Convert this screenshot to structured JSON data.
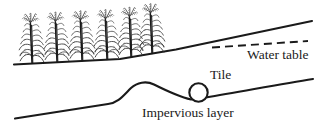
{
  "figure": {
    "type": "schematic-diagram",
    "width": 334,
    "height": 139,
    "background_color": "#ffffff",
    "line_color": "#1a1a1a"
  },
  "labels": {
    "water_table": "Water table",
    "tile": "Tile",
    "impervious_layer": "Impervious layer"
  },
  "elements": {
    "ground_surface": {
      "name": "ground-surface-line",
      "style": "solid",
      "description": "soil surface sloping upward to the right"
    },
    "water_table_line": {
      "name": "water-table-line",
      "style": "dashed",
      "description": "dashed line beneath ground surface indicating water table"
    },
    "tile_drain": {
      "name": "tile-drain-circle",
      "style": "circle outline",
      "description": "drainage tile shown in cross-section as an open circle"
    },
    "impervious_layer_line": {
      "name": "impervious-layer-line",
      "style": "solid",
      "description": "lower boundary with a mound rising beneath the field"
    },
    "crops": {
      "name": "crop-plants",
      "count": 6,
      "description": "row of corn / cereal plants growing on the ground surface"
    }
  }
}
